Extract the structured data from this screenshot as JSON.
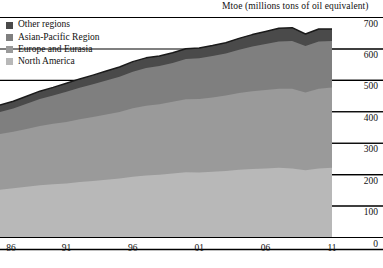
{
  "axis_title": "Mtoe (millions tons of oil equivalent)",
  "legend": {
    "items": [
      {
        "label": "Other regions",
        "color": "#4a4a4a",
        "key": "other_regions"
      },
      {
        "label": "Asian-Pacific Region",
        "color": "#7f7f7f",
        "key": "asian_pacific"
      },
      {
        "label": "Europe and Eurasia",
        "color": "#9a9a9a",
        "key": "europe_eurasia"
      },
      {
        "label": "North America",
        "color": "#b8b8b8",
        "key": "north_america"
      }
    ]
  },
  "chart_data": {
    "type": "area",
    "title": "",
    "subtitle": "",
    "xlabel": "",
    "ylabel": "Mtoe (millions tons of oil equivalent)",
    "ylim": [
      0,
      700
    ],
    "yticks": [
      0,
      100,
      200,
      300,
      400,
      500,
      600,
      700
    ],
    "ytick_labels": [
      "0",
      "100",
      "200",
      "300",
      "400",
      "500",
      "600",
      "700"
    ],
    "xlim": [
      1986,
      2011
    ],
    "xticks": [
      1986,
      1991,
      1996,
      2001,
      2006,
      2011
    ],
    "xtick_labels": [
      "86",
      "91",
      "96",
      "01",
      "06",
      "11"
    ],
    "grid": true,
    "grid_axis": "y",
    "legend_position": "top-left",
    "stacked": true,
    "stack_order_bottom_to_top": [
      "North America",
      "Europe and Eurasia",
      "Asian-Pacific Region",
      "Other regions"
    ],
    "x": [
      1986,
      1987,
      1988,
      1989,
      1990,
      1991,
      1992,
      1993,
      1994,
      1995,
      1996,
      1997,
      1998,
      1999,
      2000,
      2001,
      2002,
      2003,
      2004,
      2005,
      2006,
      2007,
      2008,
      2009,
      2010,
      2011
    ],
    "series": [
      {
        "name": "North America",
        "color": "#b8b8b8",
        "values": [
          150,
          155,
          160,
          165,
          168,
          170,
          175,
          178,
          182,
          186,
          192,
          196,
          198,
          202,
          206,
          205,
          208,
          210,
          214,
          216,
          218,
          220,
          218,
          212,
          218,
          220
        ]
      },
      {
        "name": "Europe and Eurasia",
        "color": "#9a9a9a",
        "values": [
          178,
          180,
          184,
          188,
          192,
          196,
          200,
          204,
          208,
          212,
          218,
          222,
          224,
          228,
          232,
          234,
          236,
          240,
          244,
          248,
          250,
          252,
          254,
          248,
          254,
          256
        ]
      },
      {
        "name": "Asian-Pacific Region",
        "color": "#7f7f7f",
        "values": [
          70,
          74,
          80,
          86,
          90,
          96,
          100,
          104,
          108,
          112,
          116,
          120,
          122,
          124,
          128,
          130,
          132,
          134,
          138,
          142,
          146,
          150,
          152,
          148,
          150,
          148
        ]
      },
      {
        "name": "Other regions",
        "color": "#4a4a4a",
        "values": [
          22,
          23,
          24,
          25,
          26,
          27,
          28,
          29,
          30,
          31,
          32,
          32,
          32,
          32,
          33,
          32,
          33,
          34,
          36,
          38,
          40,
          42,
          42,
          38,
          40,
          38
        ]
      }
    ],
    "totals": [
      420,
      432,
      448,
      464,
      476,
      489,
      503,
      515,
      528,
      541,
      558,
      570,
      576,
      586,
      599,
      601,
      609,
      618,
      632,
      644,
      654,
      664,
      666,
      646,
      662,
      662
    ]
  },
  "plot_geometry": {
    "left_px": 0,
    "right_px": 332,
    "top_px": 17,
    "bottom_px": 237
  },
  "colors": {
    "axis_line": "#000000",
    "grid_line": "#000000",
    "background": "#ffffff",
    "outline": "#1a1a1a"
  }
}
